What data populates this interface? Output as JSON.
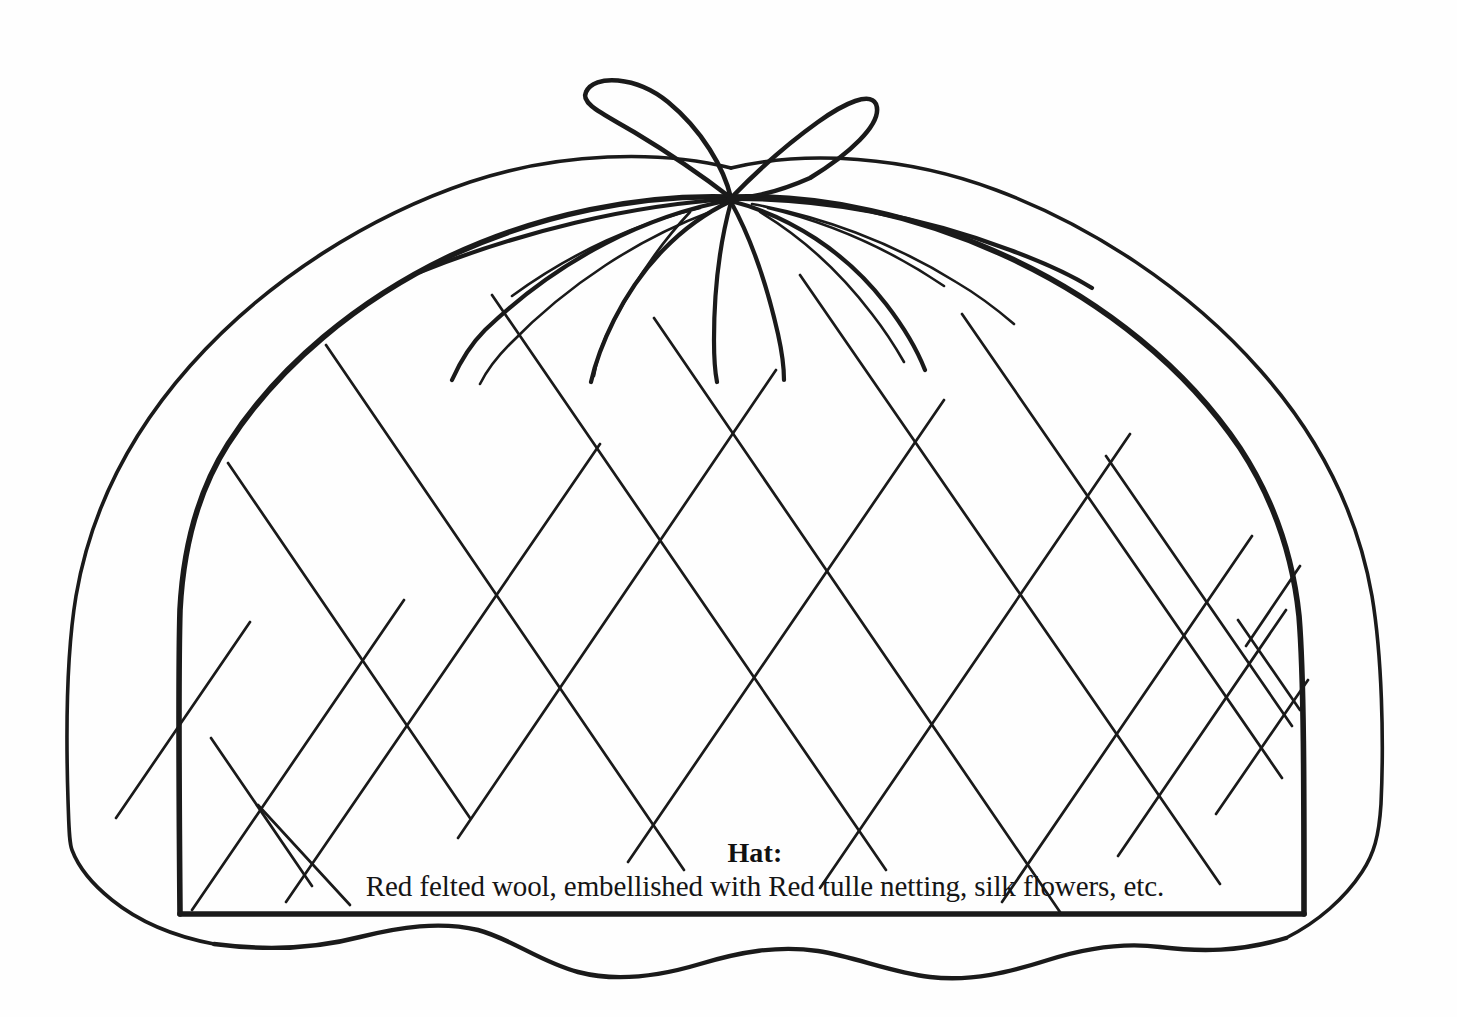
{
  "page": {
    "background_color": "#fefefe",
    "ink_color": "#1a1a1a",
    "width": 1457,
    "height": 1017
  },
  "illustration": {
    "subject": "quilted dome hat / tea-cosy line drawing",
    "style": "black-and-white line art",
    "parts": {
      "bow": "two-loop ribbon bow at apex",
      "knot": "gather knot at top centre",
      "gathers": "radiating gather lines from knot",
      "lattice": "diamond quilting lattice",
      "outer_outline": "soft puffy outer contour",
      "inner_outline": "firm inner dome outline",
      "scalloped_hem": "wavy bottom hem"
    }
  },
  "caption": {
    "title": "Hat:",
    "description": "Red felted wool, embellished with Red tulle netting, silk flowers, etc.",
    "title_color": "#111111",
    "description_color": "#151515"
  }
}
